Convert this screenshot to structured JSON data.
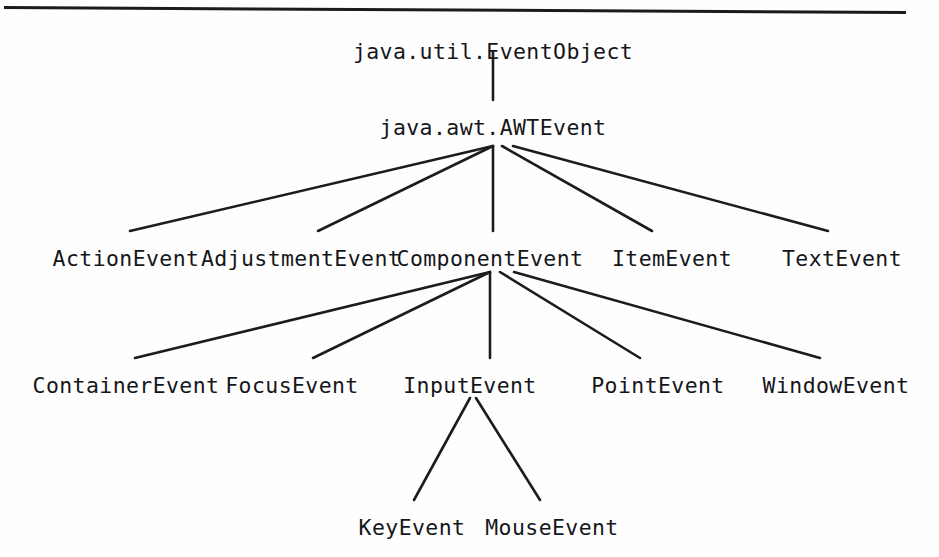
{
  "figure": {
    "kind": "class-hierarchy-diagram",
    "title_rule": true,
    "line_color": "#1c1c1c",
    "text_color": "#15161a",
    "background": "#fefefe"
  },
  "nodes": [
    {
      "id": "eventobject",
      "label": "java.util.EventObject",
      "x": 493,
      "y": 41,
      "level": 0
    },
    {
      "id": "awtevent",
      "label": "java.awt.AWTEvent",
      "x": 493,
      "y": 117,
      "level": 1
    },
    {
      "id": "actionevent",
      "label": "ActionEvent",
      "x": 126,
      "y": 248,
      "level": 2
    },
    {
      "id": "adjustmentevent",
      "label": "AdjustmentEvent",
      "x": 301,
      "y": 248,
      "level": 2
    },
    {
      "id": "componentevent",
      "label": "ComponentEvent",
      "x": 490,
      "y": 248,
      "level": 2
    },
    {
      "id": "itemevent",
      "label": "ItemEvent",
      "x": 672,
      "y": 248,
      "level": 2
    },
    {
      "id": "textevent",
      "label": "TextEvent",
      "x": 842,
      "y": 248,
      "level": 2
    },
    {
      "id": "containerevent",
      "label": "ContainerEvent",
      "x": 126,
      "y": 375,
      "level": 3
    },
    {
      "id": "focusevent",
      "label": "FocusEvent",
      "x": 292,
      "y": 375,
      "level": 3
    },
    {
      "id": "inputevent",
      "label": "InputEvent",
      "x": 470,
      "y": 375,
      "level": 3
    },
    {
      "id": "pointevent",
      "label": "PointEvent",
      "x": 658,
      "y": 375,
      "level": 3
    },
    {
      "id": "windowevent",
      "label": "WindowEvent",
      "x": 836,
      "y": 375,
      "level": 3
    },
    {
      "id": "keyevent",
      "label": "KeyEvent",
      "x": 412,
      "y": 517,
      "level": 4
    },
    {
      "id": "mouseevent",
      "label": "MouseEvent",
      "x": 552,
      "y": 517,
      "level": 4
    }
  ],
  "edges": [
    {
      "from": "eventobject",
      "to": "awtevent",
      "x1": 493,
      "y1": 52,
      "x2": 493,
      "y2": 100
    },
    {
      "from": "awtevent",
      "to": "actionevent",
      "x1": 493,
      "y1": 146,
      "x2": 130,
      "y2": 231
    },
    {
      "from": "awtevent",
      "to": "adjustmentevent",
      "x1": 493,
      "y1": 146,
      "x2": 318,
      "y2": 231
    },
    {
      "from": "awtevent",
      "to": "componentevent",
      "x1": 493,
      "y1": 146,
      "x2": 493,
      "y2": 231
    },
    {
      "from": "awtevent",
      "to": "itemevent",
      "x1": 502,
      "y1": 146,
      "x2": 652,
      "y2": 231
    },
    {
      "from": "awtevent",
      "to": "textevent",
      "x1": 513,
      "y1": 146,
      "x2": 828,
      "y2": 231
    },
    {
      "from": "componentevent",
      "to": "containerevent",
      "x1": 490,
      "y1": 272,
      "x2": 135,
      "y2": 358
    },
    {
      "from": "componentevent",
      "to": "focusevent",
      "x1": 490,
      "y1": 272,
      "x2": 313,
      "y2": 358
    },
    {
      "from": "componentevent",
      "to": "inputevent",
      "x1": 490,
      "y1": 272,
      "x2": 490,
      "y2": 358
    },
    {
      "from": "componentevent",
      "to": "pointevent",
      "x1": 500,
      "y1": 272,
      "x2": 640,
      "y2": 358
    },
    {
      "from": "componentevent",
      "to": "windowevent",
      "x1": 514,
      "y1": 272,
      "x2": 820,
      "y2": 358
    },
    {
      "from": "inputevent",
      "to": "keyevent",
      "x1": 470,
      "y1": 398,
      "x2": 414,
      "y2": 500
    },
    {
      "from": "inputevent",
      "to": "mouseevent",
      "x1": 476,
      "y1": 398,
      "x2": 540,
      "y2": 500
    }
  ]
}
